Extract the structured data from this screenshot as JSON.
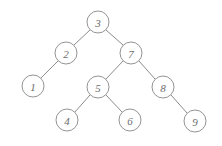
{
  "figure": {
    "kind": "binary-search-tree-diagram",
    "background_color": "#ffffff",
    "node_fill_color": "#ffffff",
    "node_stroke_color": "#949494",
    "edge_color": "#8c8c8c",
    "label_color": "#6b6b6b",
    "node_radius": 11,
    "width": 222,
    "height": 146
  },
  "nodes": [
    {
      "id": "n3",
      "label": "3",
      "cx": 98,
      "cy": 22
    },
    {
      "id": "n2",
      "label": "2",
      "cx": 66,
      "cy": 53
    },
    {
      "id": "n7",
      "label": "7",
      "cx": 131,
      "cy": 53
    },
    {
      "id": "n1",
      "label": "1",
      "cx": 33,
      "cy": 86
    },
    {
      "id": "n5",
      "label": "5",
      "cx": 98,
      "cy": 87
    },
    {
      "id": "n8",
      "label": "8",
      "cx": 163,
      "cy": 87
    },
    {
      "id": "n4",
      "label": "4",
      "cx": 67,
      "cy": 120
    },
    {
      "id": "n6",
      "label": "6",
      "cx": 130,
      "cy": 120
    },
    {
      "id": "n9",
      "label": "9",
      "cx": 195,
      "cy": 121
    }
  ],
  "edges": [
    {
      "id": "e3-2",
      "from": "n3",
      "to": "n2",
      "x1": 90,
      "y1": 30,
      "x2": 74,
      "y2": 45
    },
    {
      "id": "e3-7",
      "from": "n3",
      "to": "n7",
      "x1": 106,
      "y1": 30,
      "x2": 123,
      "y2": 45
    },
    {
      "id": "e2-1",
      "from": "n2",
      "to": "n1",
      "x1": 58,
      "y1": 61,
      "x2": 41,
      "y2": 78
    },
    {
      "id": "e7-5",
      "from": "n7",
      "to": "n5",
      "x1": 123,
      "y1": 61,
      "x2": 106,
      "y2": 79
    },
    {
      "id": "e7-8",
      "from": "n7",
      "to": "n8",
      "x1": 139,
      "y1": 61,
      "x2": 155,
      "y2": 79
    },
    {
      "id": "e5-4",
      "from": "n5",
      "to": "n4",
      "x1": 90,
      "y1": 95,
      "x2": 75,
      "y2": 112
    },
    {
      "id": "e5-6",
      "from": "n5",
      "to": "n6",
      "x1": 106,
      "y1": 95,
      "x2": 122,
      "y2": 112
    },
    {
      "id": "e8-9",
      "from": "n8",
      "to": "n9",
      "x1": 171,
      "y1": 95,
      "x2": 187,
      "y2": 113
    }
  ]
}
